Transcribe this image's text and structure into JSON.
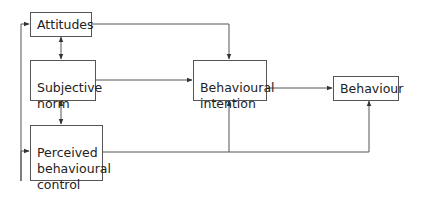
{
  "diagram": {
    "nodes": {
      "attitudes": {
        "label": "Attitudes"
      },
      "subjective_norm": {
        "label": "Subjective\nnorm"
      },
      "perceived_control": {
        "label": "Perceived\nbehavioural\ncontrol"
      },
      "intention": {
        "label": "Behavioural\nintention"
      },
      "behaviour": {
        "label": "Behaviour"
      }
    },
    "edges": [
      {
        "from": "attitudes",
        "to": "subjective_norm",
        "type": "bidirectional"
      },
      {
        "from": "subjective_norm",
        "to": "perceived_control",
        "type": "bidirectional"
      },
      {
        "from": "attitudes",
        "to": "perceived_control",
        "type": "bidirectional",
        "route": "left-bracket"
      },
      {
        "from": "attitudes",
        "to": "intention",
        "type": "directed"
      },
      {
        "from": "subjective_norm",
        "to": "intention",
        "type": "directed"
      },
      {
        "from": "perceived_control",
        "to": "intention",
        "type": "directed"
      },
      {
        "from": "perceived_control",
        "to": "behaviour",
        "type": "directed"
      },
      {
        "from": "intention",
        "to": "behaviour",
        "type": "directed"
      }
    ],
    "colors": {
      "line": "#555555",
      "text": "#222222",
      "background": "#ffffff"
    }
  }
}
